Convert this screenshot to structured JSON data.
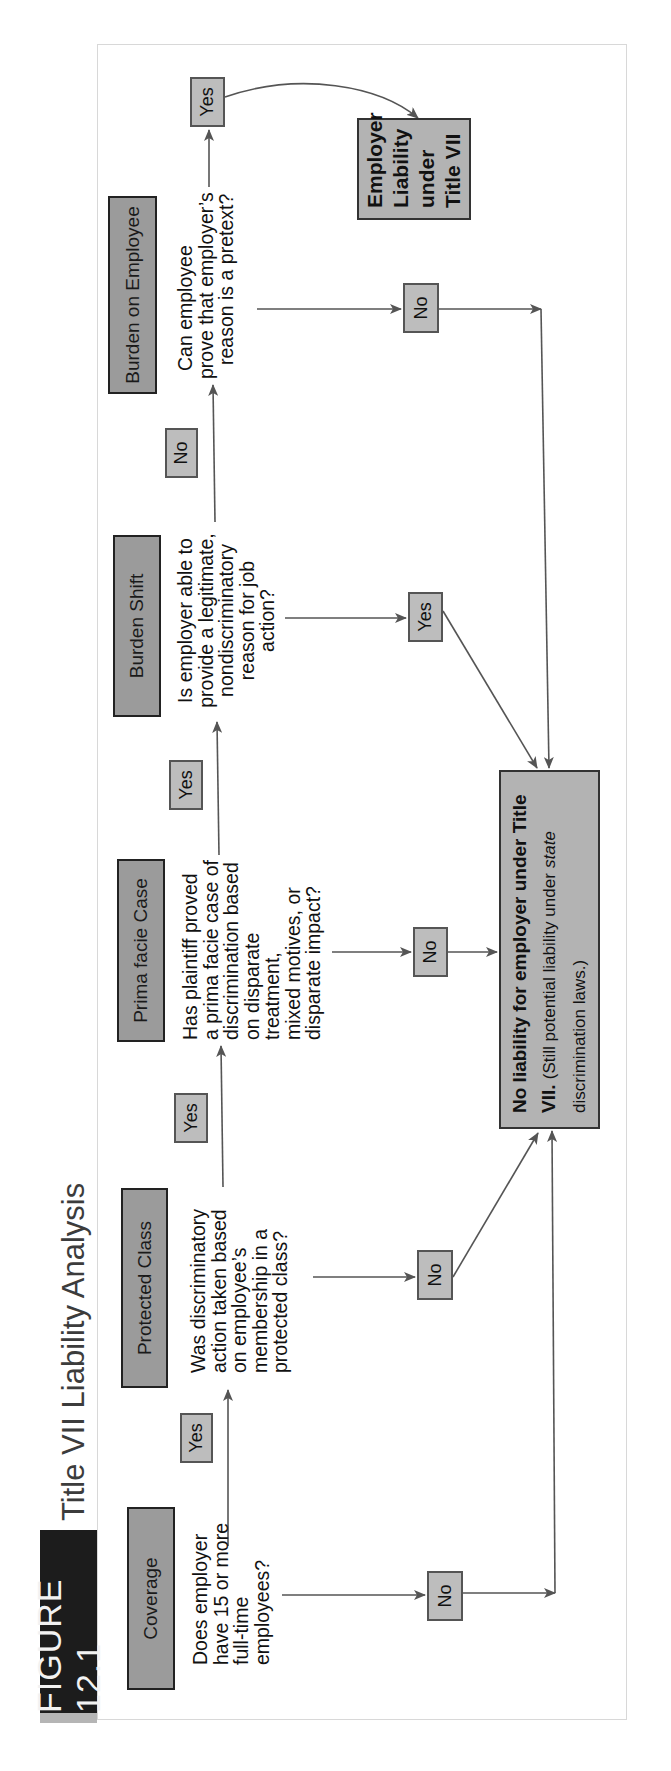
{
  "figure": {
    "label": "FIGURE 12.1",
    "title": "Title VII Liability Analysis",
    "orientation": "rotated 90 degrees counterclockwise"
  },
  "colors": {
    "header_box": "#9b9b9b",
    "answer_tag": "#bdbdbd",
    "result_box": "#b3b3b3",
    "figure_label_bg": "#1c1c1c",
    "line": "#555555"
  },
  "steps": [
    {
      "header": "Coverage",
      "question_lines": [
        "Does employer",
        "have 15 or more",
        "full-time employees?"
      ]
    },
    {
      "header": "Protected Class",
      "question_lines": [
        "Was discriminatory",
        "action taken based",
        "on employee’s",
        "membership in a",
        "protected class?"
      ]
    },
    {
      "header": "Prima facie Case",
      "question_lines": [
        "Has plaintiff proved",
        "a prima facie case of",
        "discrimination based",
        "on disparate treatment,",
        "mixed motives, or",
        "disparate impact?"
      ]
    },
    {
      "header": "Burden Shift",
      "question_lines": [
        "Is employer able to",
        "provide a legitimate,",
        "nondiscriminatory",
        "reason for job action?"
      ]
    },
    {
      "header": "Burden on Employee",
      "question_lines": [
        "Can employee",
        "prove that employer’s",
        "reason is a pretext?"
      ]
    }
  ],
  "answers": {
    "coverage_yes": "Yes",
    "coverage_no": "No",
    "protected_yes": "Yes",
    "protected_no": "No",
    "prima_yes": "Yes",
    "prima_no": "No",
    "burden_shift_yes": "Yes",
    "burden_shift_no": "No",
    "burden_employee_yes": "Yes",
    "burden_employee_no": "No"
  },
  "results": {
    "no_liability": {
      "bold": "No liability for employer under Title VII.",
      "note_prefix": "(Still potential liability under",
      "note_italic": "state",
      "note_suffix": "discrimination laws.)"
    },
    "liability": {
      "lines": [
        "Employer",
        "Liability",
        "under",
        "Title VII"
      ]
    }
  }
}
